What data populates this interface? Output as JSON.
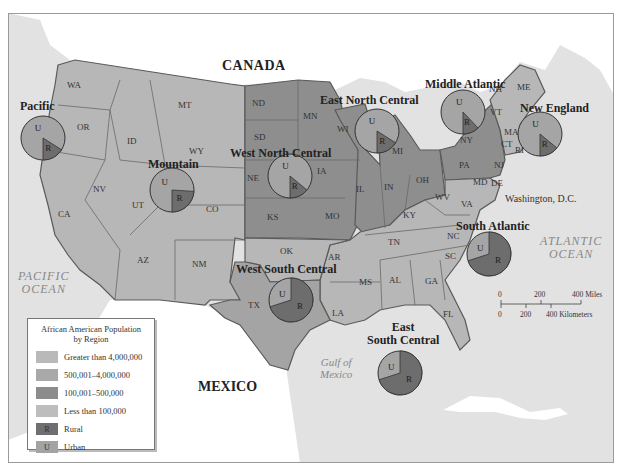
{
  "map": {
    "labels": {
      "canada": "CANADA",
      "mexico": "MEXICO",
      "pacific_ocean": [
        "PACIFIC",
        "OCEAN"
      ],
      "atlantic_ocean": [
        "ATLANTIC",
        "OCEAN"
      ],
      "gulf": [
        "Gulf of",
        "Mexico"
      ],
      "washington_dc": "Washington, D.C."
    },
    "states": [
      {
        "abbr": "WA",
        "x": 75,
        "y": 86,
        "cat": "low"
      },
      {
        "abbr": "OR",
        "x": 85,
        "y": 128,
        "cat": "low"
      },
      {
        "abbr": "CA",
        "x": 66,
        "y": 215,
        "cat": "mid"
      },
      {
        "abbr": "NV",
        "x": 101,
        "y": 190,
        "cat": "low"
      },
      {
        "abbr": "ID",
        "x": 135,
        "y": 142,
        "cat": "low"
      },
      {
        "abbr": "MT",
        "x": 186,
        "y": 106,
        "cat": "low"
      },
      {
        "abbr": "WY",
        "x": 197,
        "y": 152,
        "cat": "low"
      },
      {
        "abbr": "UT",
        "x": 140,
        "y": 206,
        "cat": "low"
      },
      {
        "abbr": "CO",
        "x": 214,
        "y": 210,
        "cat": "low"
      },
      {
        "abbr": "AZ",
        "x": 145,
        "y": 261,
        "cat": "low"
      },
      {
        "abbr": "NM",
        "x": 200,
        "y": 265,
        "cat": "low"
      },
      {
        "abbr": "ND",
        "x": 260,
        "y": 104,
        "cat": "mid"
      },
      {
        "abbr": "SD",
        "x": 262,
        "y": 138,
        "cat": "mid"
      },
      {
        "abbr": "NE",
        "x": 255,
        "y": 179,
        "cat": "mid"
      },
      {
        "abbr": "KS",
        "x": 275,
        "y": 218,
        "cat": "mid"
      },
      {
        "abbr": "MN",
        "x": 311,
        "y": 117,
        "cat": "mid"
      },
      {
        "abbr": "IA",
        "x": 325,
        "y": 172,
        "cat": "mid"
      },
      {
        "abbr": "MO",
        "x": 333,
        "y": 217,
        "cat": "mid"
      },
      {
        "abbr": "WI",
        "x": 345,
        "y": 130,
        "cat": "mid"
      },
      {
        "abbr": "IL",
        "x": 364,
        "y": 190,
        "cat": "mid"
      },
      {
        "abbr": "IN",
        "x": 392,
        "y": 188,
        "cat": "mid"
      },
      {
        "abbr": "MI",
        "x": 400,
        "y": 152,
        "cat": "mid"
      },
      {
        "abbr": "OH",
        "x": 424,
        "y": 181,
        "cat": "mid"
      },
      {
        "abbr": "KY",
        "x": 411,
        "y": 216,
        "cat": "low"
      },
      {
        "abbr": "TN",
        "x": 396,
        "y": 243,
        "cat": "low"
      },
      {
        "abbr": "OK",
        "x": 288,
        "y": 252,
        "cat": "low"
      },
      {
        "abbr": "AR",
        "x": 336,
        "y": 258,
        "cat": "low"
      },
      {
        "abbr": "TX",
        "x": 256,
        "y": 306,
        "cat": "mid"
      },
      {
        "abbr": "LA",
        "x": 340,
        "y": 314,
        "cat": "low"
      },
      {
        "abbr": "MS",
        "x": 367,
        "y": 283,
        "cat": "low"
      },
      {
        "abbr": "AL",
        "x": 397,
        "y": 281,
        "cat": "low"
      },
      {
        "abbr": "GA",
        "x": 433,
        "y": 282,
        "cat": "low"
      },
      {
        "abbr": "FL",
        "x": 451,
        "y": 315,
        "cat": "low"
      },
      {
        "abbr": "SC",
        "x": 453,
        "y": 257,
        "cat": "low"
      },
      {
        "abbr": "NC",
        "x": 455,
        "y": 237,
        "cat": "low"
      },
      {
        "abbr": "VA",
        "x": 469,
        "y": 205,
        "cat": "low"
      },
      {
        "abbr": "WV",
        "x": 443,
        "y": 198,
        "cat": "low"
      },
      {
        "abbr": "PA",
        "x": 467,
        "y": 166,
        "cat": "mid"
      },
      {
        "abbr": "NY",
        "x": 468,
        "y": 141,
        "cat": "mid"
      },
      {
        "abbr": "NJ",
        "x": 502,
        "y": 166,
        "cat": "low"
      },
      {
        "abbr": "MD",
        "x": 481,
        "y": 183,
        "cat": "low"
      },
      {
        "abbr": "DE",
        "x": 499,
        "y": 184,
        "cat": "low"
      },
      {
        "abbr": "VT",
        "x": 498,
        "y": 113,
        "cat": "low"
      },
      {
        "abbr": "NH",
        "x": 497,
        "y": 90,
        "cat": "low"
      },
      {
        "abbr": "ME",
        "x": 525,
        "y": 88,
        "cat": "low"
      },
      {
        "abbr": "MA",
        "x": 512,
        "y": 133,
        "cat": "low"
      },
      {
        "abbr": "CT",
        "x": 509,
        "y": 145,
        "cat": "low"
      },
      {
        "abbr": "RI",
        "x": 523,
        "y": 151,
        "cat": "low"
      }
    ],
    "regions": [
      {
        "name": "Pacific",
        "label_x": 20,
        "label_y": 109,
        "cx": 43,
        "cy": 138,
        "r": 22,
        "rural_pct": 16
      },
      {
        "name": "Mountain",
        "label_x": 148,
        "label_y": 167,
        "cx": 172,
        "cy": 190,
        "r": 22,
        "rural_pct": 24
      },
      {
        "name": "West North Central",
        "label_x": 230,
        "label_y": 156,
        "cx": 290,
        "cy": 176,
        "r": 22,
        "rural_pct": 14
      },
      {
        "name": "East North Central",
        "label_x": 320,
        "label_y": 103,
        "cx": 377,
        "cy": 131,
        "r": 22,
        "rural_pct": 16
      },
      {
        "name": "Middle Atlantic",
        "label_x": 425,
        "label_y": 87,
        "cx": 463,
        "cy": 112,
        "r": 22,
        "rural_pct": 12
      },
      {
        "name": "New England",
        "label_x": 520,
        "label_y": 111,
        "cx": 540,
        "cy": 134,
        "r": 22,
        "rural_pct": 14
      },
      {
        "name": "South Atlantic",
        "label_x": 456,
        "label_y": 229,
        "cx": 489,
        "cy": 254,
        "r": 22,
        "rural_pct": 70
      },
      {
        "name": "West South Central",
        "label_x": 236,
        "label_y": 272,
        "cx": 291,
        "cy": 300,
        "r": 22,
        "rural_pct": 70
      },
      {
        "name": "East South Central",
        "label_x": 367,
        "label_y": 330,
        "cx": 400,
        "cy": 373,
        "r": 22,
        "rural_pct": 70
      }
    ],
    "east_south_central_label": [
      "East",
      "South Central"
    ]
  },
  "scale_bar": {
    "miles_ticks": [
      "0",
      "200",
      "400 Miles"
    ],
    "km_ticks": [
      "0",
      "200",
      "400 Kilometers"
    ]
  },
  "legend": {
    "title_line1": "African American Population",
    "title_line2": "by Region",
    "items": [
      {
        "label": "Greater than 4,000,000",
        "color": "#b9b9b9",
        "symbol": ""
      },
      {
        "label": "500,001–4,000,000",
        "color": "#a9a9a9",
        "symbol": ""
      },
      {
        "label": "100,001–500,000",
        "color": "#8c8c8c",
        "symbol": ""
      },
      {
        "label": "Less than 100,000",
        "color": "#bdbdbd",
        "symbol": ""
      },
      {
        "label": "Rural",
        "color": "#6f6f6f",
        "symbol": "R"
      },
      {
        "label": "Urban",
        "color": "#a3a3a3",
        "symbol": "U"
      }
    ]
  },
  "colors": {
    "water": "#e4e4e4",
    "land_foreign": "#ffffff",
    "state_low": "#b7b7b7",
    "state_mid": "#8e8e8e",
    "urban": "#a5a5a5",
    "rural": "#6d6d6d",
    "border": "#5a5a5a"
  }
}
